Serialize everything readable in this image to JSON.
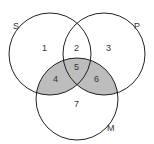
{
  "diagram": {
    "type": "venn",
    "sets": [
      {
        "name": "S",
        "label": "S"
      },
      {
        "name": "P",
        "label": "P"
      },
      {
        "name": "M",
        "label": "M"
      }
    ],
    "regions": [
      "1",
      "2",
      "3",
      "4",
      "5",
      "6",
      "7"
    ],
    "shaded_regions": [
      "4",
      "5",
      "6"
    ],
    "shade_color": "#bdbdbd",
    "stroke_color": "#222222"
  }
}
